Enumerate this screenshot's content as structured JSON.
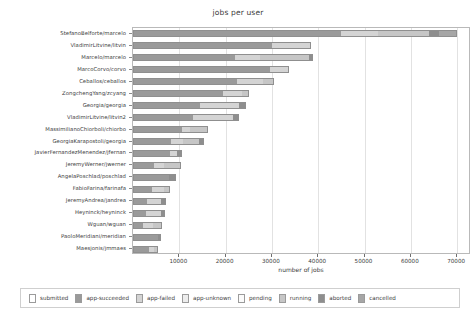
{
  "chart_data": {
    "type": "bar",
    "orientation": "horizontal",
    "stacked": true,
    "title": "jobs per user",
    "xlabel": "number of jobs",
    "ylabel": "",
    "xlim": [
      0,
      73000
    ],
    "xticks": [
      10000,
      20000,
      30000,
      40000,
      50000,
      60000,
      70000
    ],
    "xticklabels": [
      "10000",
      "20000",
      "30000",
      "40000",
      "50000",
      "60000",
      "70000"
    ],
    "grid": true,
    "legend_position": "bottom",
    "series": [
      {
        "name": "submitted",
        "color": "#ffffff"
      },
      {
        "name": "app-succeeded",
        "color": "#9a9a9a"
      },
      {
        "name": "app-failed",
        "color": "#d4d4d4"
      },
      {
        "name": "app-unknown",
        "color": "#ededed"
      },
      {
        "name": "pending",
        "color": "#fbfbfb"
      },
      {
        "name": "running",
        "color": "#c6c6c6"
      },
      {
        "name": "aborted",
        "color": "#8e8e8e"
      },
      {
        "name": "cancelled",
        "color": "#a6a6a6"
      }
    ],
    "categories": [
      "StefanoBelforte/marcelo",
      "VladimirLitvine/litvin",
      "Marcelo/marcelo",
      "MarcoCorvo/corvo",
      "Ceballos/ceballos",
      "ZongchengYang/zcyang",
      "Georgia/georgia",
      "VladimirLitvine/litvin2",
      "MassimilianoChiorboli/chiorbo",
      "GeorgiaKarapostoli/georgia",
      "JavierFernandezMenendez/jfernan",
      "JeremyWerner/jwerner",
      "AngelaPoschlad/poschlad",
      "FabioFarina/farinafa",
      "JeremyAndrea/jandrea",
      "Heyninck/heyninck",
      "Wguan/wguan",
      "PaoloMeridiani/meridian",
      "Maesjonis/jmmaes"
    ],
    "rows": [
      {
        "category": "StefanoBelforte/marcelo",
        "total": 70000,
        "segments": [
          {
            "series": "app-succeeded",
            "value": 45000
          },
          {
            "series": "app-failed",
            "value": 8000
          },
          {
            "series": "running",
            "value": 11000
          },
          {
            "series": "aborted",
            "value": 2000
          },
          {
            "series": "cancelled",
            "value": 4000
          }
        ]
      },
      {
        "category": "VladimirLitvine/litvin",
        "total": 38500,
        "segments": [
          {
            "series": "app-succeeded",
            "value": 30000
          },
          {
            "series": "app-failed",
            "value": 8200
          },
          {
            "series": "aborted",
            "value": 300
          }
        ]
      },
      {
        "category": "Marcelo/marcelo",
        "total": 38800,
        "segments": [
          {
            "series": "app-succeeded",
            "value": 22000
          },
          {
            "series": "app-failed",
            "value": 5500
          },
          {
            "series": "running",
            "value": 10500
          },
          {
            "series": "aborted",
            "value": 800
          }
        ]
      },
      {
        "category": "MarcoCorvo/corvo",
        "total": 33800,
        "segments": [
          {
            "series": "app-succeeded",
            "value": 29500
          },
          {
            "series": "app-failed",
            "value": 4300
          }
        ]
      },
      {
        "category": "Ceballos/ceballos",
        "total": 30500,
        "segments": [
          {
            "series": "app-succeeded",
            "value": 22500
          },
          {
            "series": "app-failed",
            "value": 5500
          },
          {
            "series": "running",
            "value": 2500
          }
        ]
      },
      {
        "category": "ZongchengYang/zcyang",
        "total": 25000,
        "segments": [
          {
            "series": "app-succeeded",
            "value": 19500
          },
          {
            "series": "app-failed",
            "value": 4000
          },
          {
            "series": "running",
            "value": 1500
          }
        ]
      },
      {
        "category": "Georgia/georgia",
        "total": 24500,
        "segments": [
          {
            "series": "app-succeeded",
            "value": 14500
          },
          {
            "series": "app-failed",
            "value": 8500
          },
          {
            "series": "aborted",
            "value": 1500
          }
        ]
      },
      {
        "category": "VladimirLitvine/litvin2",
        "total": 23000,
        "segments": [
          {
            "series": "app-succeeded",
            "value": 13000
          },
          {
            "series": "app-failed",
            "value": 8500
          },
          {
            "series": "aborted",
            "value": 1500
          }
        ]
      },
      {
        "category": "MassimilianoChiorboli/chiorbo",
        "total": 16200,
        "segments": [
          {
            "series": "app-succeeded",
            "value": 10500
          },
          {
            "series": "app-failed",
            "value": 1800
          },
          {
            "series": "running",
            "value": 3900
          }
        ]
      },
      {
        "category": "GeorgiaKarapostoli/georgia",
        "total": 15300,
        "segments": [
          {
            "series": "app-succeeded",
            "value": 8200
          },
          {
            "series": "app-failed",
            "value": 2600
          },
          {
            "series": "running",
            "value": 3500
          },
          {
            "series": "aborted",
            "value": 1000
          }
        ]
      },
      {
        "category": "JavierFernandezMenendez/jfernan",
        "total": 10500,
        "segments": [
          {
            "series": "app-succeeded",
            "value": 8000
          },
          {
            "series": "app-failed",
            "value": 1400
          },
          {
            "series": "aborted",
            "value": 1100
          }
        ]
      },
      {
        "category": "JeremyWerner/jwerner",
        "total": 10300,
        "segments": [
          {
            "series": "app-succeeded",
            "value": 4500
          },
          {
            "series": "app-failed",
            "value": 2300
          },
          {
            "series": "running",
            "value": 3500
          }
        ]
      },
      {
        "category": "AngelaPoschlad/poschlad",
        "total": 9200,
        "segments": [
          {
            "series": "app-succeeded",
            "value": 7700
          },
          {
            "series": "aborted",
            "value": 1500
          }
        ]
      },
      {
        "category": "FabioFarina/farinafa",
        "total": 8000,
        "segments": [
          {
            "series": "app-succeeded",
            "value": 4200
          },
          {
            "series": "app-failed",
            "value": 2500
          },
          {
            "series": "running",
            "value": 1300
          }
        ]
      },
      {
        "category": "JeremyAndrea/jandrea",
        "total": 7100,
        "segments": [
          {
            "series": "app-succeeded",
            "value": 3000
          },
          {
            "series": "app-failed",
            "value": 3000
          },
          {
            "series": "aborted",
            "value": 1100
          }
        ]
      },
      {
        "category": "Heyninck/heyninck",
        "total": 6900,
        "segments": [
          {
            "series": "app-succeeded",
            "value": 2700
          },
          {
            "series": "app-failed",
            "value": 3300
          },
          {
            "series": "aborted",
            "value": 900
          }
        ]
      },
      {
        "category": "Wguan/wguan",
        "total": 6300,
        "segments": [
          {
            "series": "app-succeeded",
            "value": 2100
          },
          {
            "series": "app-failed",
            "value": 2300
          },
          {
            "series": "running",
            "value": 1900
          }
        ]
      },
      {
        "category": "PaoloMeridiani/meridian",
        "total": 6100,
        "segments": [
          {
            "series": "app-succeeded",
            "value": 5300
          },
          {
            "series": "aborted",
            "value": 800
          }
        ]
      },
      {
        "category": "Maesjonis/jmmaes",
        "total": 5400,
        "segments": [
          {
            "series": "app-succeeded",
            "value": 3400
          },
          {
            "series": "app-failed",
            "value": 1200
          },
          {
            "series": "running",
            "value": 800
          }
        ]
      }
    ]
  }
}
